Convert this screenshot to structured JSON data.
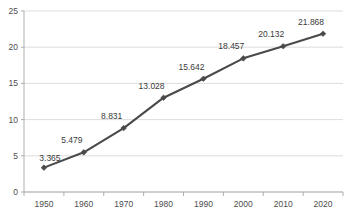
{
  "chart_data": {
    "type": "line",
    "title": "",
    "subtitle": "",
    "xlabel": "",
    "ylabel": "",
    "categories": [
      "1950",
      "1960",
      "1970",
      "1980",
      "1990",
      "2000",
      "2010",
      "2020"
    ],
    "x": [
      1950,
      1960,
      1970,
      1980,
      1990,
      2000,
      2010,
      2020
    ],
    "values": [
      3.365,
      5.479,
      8.831,
      13.028,
      15.642,
      18.457,
      20.132,
      21.868
    ],
    "data_labels": [
      "3.365",
      "5.479",
      "8.831",
      "13.028",
      "15.642",
      "18.457",
      "20.132",
      "21.868"
    ],
    "ylim": [
      0,
      25
    ],
    "xlim": [
      1945,
      2025
    ],
    "y_ticks": [
      0,
      5,
      10,
      15,
      20,
      25
    ],
    "y_tick_labels": [
      "0",
      "5",
      "10",
      "15",
      "20",
      "25"
    ],
    "x_tick_labels": [
      "1950",
      "1960",
      "1970",
      "1980",
      "1990",
      "2000",
      "2010",
      "2020"
    ],
    "grid": "horizontal",
    "legend": "none",
    "series": [
      {
        "name": "",
        "values": [
          3.365,
          5.479,
          8.831,
          13.028,
          15.642,
          18.457,
          20.132,
          21.868
        ],
        "line_color": "#4a4a4a",
        "marker": "diamond",
        "marker_color": "#4a4a4a"
      }
    ],
    "colors": {
      "line": "#4a4a4a",
      "marker": "#4a4a4a",
      "gridline": "#d4d4d4",
      "axis": "#a6a6a6",
      "tick_text": "#4d4d4d",
      "label_text": "#3a3a3a",
      "plot_background": "#ffffff"
    }
  }
}
